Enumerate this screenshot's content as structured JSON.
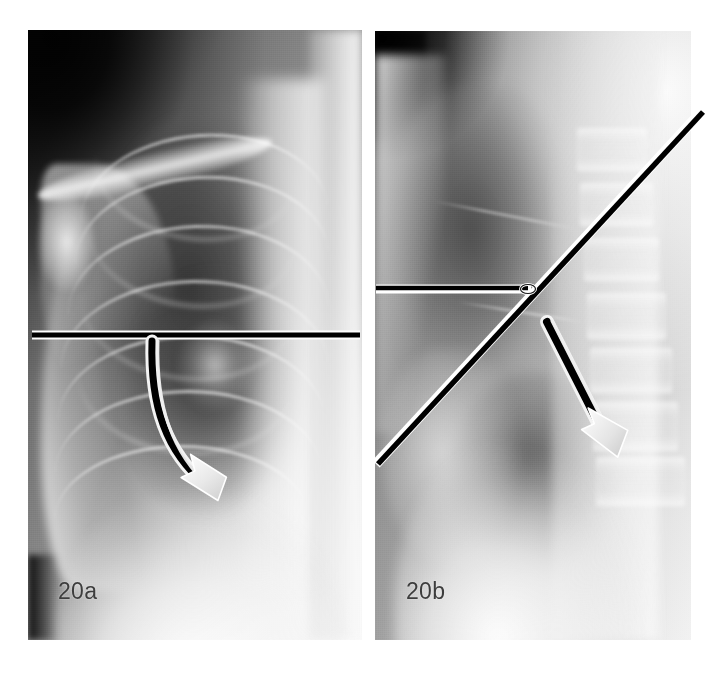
{
  "figure": {
    "background_color": "#ffffff",
    "panel_count": 2
  },
  "panels": [
    {
      "id": "panel-a",
      "caption": "20a",
      "modality": "chest radiograph",
      "view": "frontal (PA)",
      "caption_color": "#3d3d3d",
      "frame": {
        "x": 28,
        "y": 30,
        "width": 334,
        "height": 610
      },
      "annotations": [
        {
          "kind": "reference-line",
          "name": "horizontal-reference-line",
          "orientation": "horizontal",
          "color": "#000000",
          "outline_color": "#ffffff",
          "stroke_width": 6,
          "x1": 32,
          "y1": 335,
          "x2": 360,
          "y2": 335
        },
        {
          "kind": "curved-arrow",
          "name": "curved-excursion-arrow",
          "shaft_color": "#000000",
          "shaft_outline_color": "#f2f2f2",
          "head_color": "#e6e6e6",
          "head_outline_color": "#ffffff",
          "start": [
            154,
            341
          ],
          "control": [
            158,
            440
          ],
          "end": [
            211,
            494
          ],
          "direction": "clockwise down-right"
        }
      ]
    },
    {
      "id": "panel-b",
      "caption": "20b",
      "modality": "chest radiograph",
      "view": "lateral",
      "caption_color": "#3d3d3d",
      "frame": {
        "x": 375,
        "y": 31,
        "width": 316,
        "height": 609
      },
      "annotations": [
        {
          "kind": "reference-line",
          "name": "oblique-axis-line",
          "orientation": "oblique",
          "color": "#000000",
          "outline_color": "#ffffff",
          "stroke_width": 6,
          "x1": 376,
          "y1": 463,
          "x2": 702,
          "y2": 111
        },
        {
          "kind": "reference-line",
          "name": "horizontal-baseline",
          "orientation": "horizontal",
          "color": "#000000",
          "outline_color": "#ffffff",
          "stroke_width": 6,
          "x1": 376,
          "y1": 289,
          "x2": 522,
          "y2": 289
        },
        {
          "kind": "vertex-marker",
          "name": "angle-vertex-marker",
          "shape": "small-loop",
          "color": "#ffffff",
          "outline_color": "#000000",
          "cx": 528,
          "cy": 289,
          "rx": 7,
          "ry": 4
        },
        {
          "kind": "straight-arrow",
          "name": "straight-direction-arrow",
          "shaft_color": "#000000",
          "shaft_outline_color": "#f2f2f2",
          "head_color": "#e6e6e6",
          "head_outline_color": "#ffffff",
          "start": [
            547,
            322
          ],
          "end": [
            611,
            447
          ],
          "direction": "down-right"
        }
      ]
    }
  ],
  "colors": {
    "page_background": "#ffffff",
    "annotation_black": "#000000",
    "annotation_white": "#ffffff",
    "arrowhead_gray": "#e6e6e6",
    "caption_text": "#3d3d3d"
  }
}
